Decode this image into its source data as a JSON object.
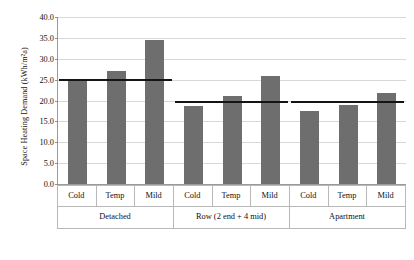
{
  "chart_data": {
    "type": "bar",
    "title": "",
    "xlabel": "",
    "ylabel": "Space Heating Demand (kWh/m²a)",
    "ylim": [
      0.0,
      40.0
    ],
    "yticks": [
      "0.0",
      "5.0",
      "10.0",
      "15.0",
      "20.0",
      "25.0",
      "30.0",
      "35.0",
      "40.0"
    ],
    "ytick_values": [
      0.0,
      5.0,
      10.0,
      15.0,
      20.0,
      25.0,
      30.0,
      35.0,
      40.0
    ],
    "grid": "horizontal",
    "legend": "none",
    "bar_color": "#6e6e6e",
    "reference_line_color": "#141414",
    "categories": [
      "Cold",
      "Temp",
      "Mild",
      "Cold",
      "Temp",
      "Mild",
      "Cold",
      "Temp",
      "Mild"
    ],
    "groups": [
      {
        "label": "Detached",
        "categories": [
          "Cold",
          "Temp",
          "Mild"
        ],
        "values": [
          24.7,
          27.1,
          34.4
        ],
        "reference_line": 25.2
      },
      {
        "label": "Row (2 end + 4 mid)",
        "categories": [
          "Cold",
          "Temp",
          "Mild"
        ],
        "values": [
          18.8,
          21.2,
          25.8
        ],
        "reference_line": 20.0
      },
      {
        "label": "Apartment",
        "categories": [
          "Cold",
          "Temp",
          "Mild"
        ],
        "values": [
          17.5,
          19.0,
          21.9
        ],
        "reference_line": 20.0
      }
    ],
    "values": [
      24.7,
      27.1,
      34.4,
      18.8,
      21.2,
      25.8,
      17.5,
      19.0,
      21.9
    ],
    "reference_lines": [
      {
        "group": "Detached",
        "value": 25.2
      },
      {
        "group": "Row (2 end + 4 mid)",
        "value": 20.0
      },
      {
        "group": "Apartment",
        "value": 20.0
      }
    ]
  }
}
